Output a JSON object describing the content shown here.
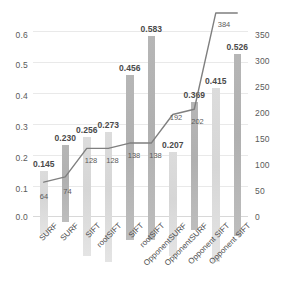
{
  "chart_data": {
    "type": "bar",
    "title": "",
    "subtitle": "",
    "xlabel": "",
    "ylabel": "",
    "y2label": "",
    "grid": true,
    "legend": "none",
    "categories": [
      "SURF",
      "SURF",
      "SIFT",
      "rootSIFT",
      "SIFT",
      "rootSIFT",
      "OpponentSURF",
      "OpponentSURF",
      "Opponent SIFT",
      "Opponent SIFT"
    ],
    "ylim": [
      0.0,
      0.6
    ],
    "yticks": [
      "0.0",
      "0.1",
      "0.2",
      "0.3",
      "0.4",
      "0.5",
      "0.6"
    ],
    "y2lim": [
      0,
      350
    ],
    "y2ticks": [
      "0",
      "50",
      "100",
      "150",
      "200",
      "250",
      "300",
      "350"
    ],
    "series": [
      {
        "name": "bars",
        "type": "bar",
        "axis": "left",
        "values": [
          0.145,
          0.23,
          0.256,
          0.273,
          0.456,
          0.583,
          0.207,
          0.369,
          0.415,
          0.526
        ],
        "labels": [
          "0.145",
          "0.230",
          "0.256",
          "0.273",
          "0.456",
          "0.583",
          "0.207",
          "0.369",
          "0.415",
          "0.526"
        ],
        "colors": [
          "#dcdcdc",
          "#b6b6b6",
          "#dcdcdc",
          "#dcdcdc",
          "#b6b6b6",
          "#b6b6b6",
          "#e2e2e2",
          "#b6b6b6",
          "#dcdcdc",
          "#b6b6b6"
        ]
      },
      {
        "name": "line",
        "type": "line",
        "axis": "right",
        "values": [
          64,
          74,
          128,
          128,
          138,
          138,
          192,
          202,
          384,
          384
        ],
        "labels": [
          "64",
          "74",
          "128",
          "128",
          "138",
          "138",
          "192",
          "202",
          "384",
          ""
        ],
        "color": "#7f7f7f"
      }
    ]
  }
}
